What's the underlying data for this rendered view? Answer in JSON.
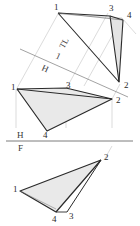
{
  "figure": {
    "background_color": "#ffffff",
    "fill_color": "#e9e9e9",
    "line_color": "#2a2a2a",
    "construction_line_color": "#b8b8b8",
    "fold_line_color": "#7a7a7a"
  },
  "fold_lines": {
    "hf": {
      "upper_label": "H",
      "lower_label": "F"
    },
    "h1": {
      "upper_label": "1",
      "lower_label": "H"
    }
  },
  "annotations": {
    "true_length": "TL"
  },
  "views": {
    "auxiliary": {
      "name": "auxiliary-view",
      "vertices": [
        {
          "id": "v1",
          "label": "1"
        },
        {
          "id": "v3",
          "label": "3"
        },
        {
          "id": "v4",
          "label": "4"
        },
        {
          "id": "v2",
          "label": "2"
        }
      ]
    },
    "horizontal": {
      "name": "horizontal-view",
      "vertices": [
        {
          "id": "v1",
          "label": "1"
        },
        {
          "id": "v3",
          "label": "3"
        },
        {
          "id": "v2",
          "label": "2"
        },
        {
          "id": "v4",
          "label": "4"
        }
      ]
    },
    "frontal": {
      "name": "frontal-view",
      "vertices": [
        {
          "id": "v2",
          "label": "2"
        },
        {
          "id": "v1",
          "label": "1"
        },
        {
          "id": "v4",
          "label": "4"
        },
        {
          "id": "v3",
          "label": "3"
        }
      ]
    }
  }
}
